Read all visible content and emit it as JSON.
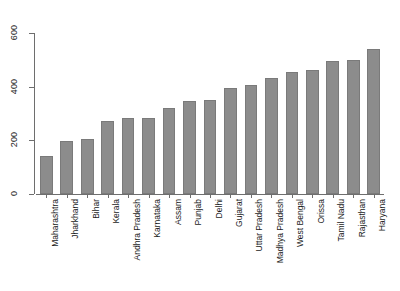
{
  "chart_data": {
    "type": "bar",
    "title": "",
    "subtitle": "",
    "xlabel": "",
    "ylabel": "",
    "categories": [
      "Maharashtra",
      "Jharkhand",
      "Bihar",
      "Kerala",
      "Andhra Pradesh",
      "Karnataka",
      "Assam",
      "Punjab",
      "Delhi",
      "Gujarat",
      "Uttar Pradesh",
      "Madhya Pradesh",
      "West Bengal",
      "Orissa",
      "Tamil Nadu",
      "Rajasthan",
      "Haryana"
    ],
    "values": [
      140,
      197,
      205,
      272,
      283,
      285,
      320,
      345,
      352,
      395,
      408,
      433,
      455,
      463,
      495,
      500,
      540
    ],
    "ylim": [
      0,
      620
    ],
    "yticks": [
      0,
      200,
      400,
      600
    ],
    "ytick_labels": [
      "0",
      "200",
      "400",
      "600"
    ],
    "grid": false,
    "legend": false,
    "legend_position": "none",
    "bar_color": "#8c8c8c",
    "bar_border_color": "#7a7a7a",
    "axis_color": "#6e6e6e",
    "background_color": "#ffffff",
    "xtick_label_rotation": 90
  }
}
